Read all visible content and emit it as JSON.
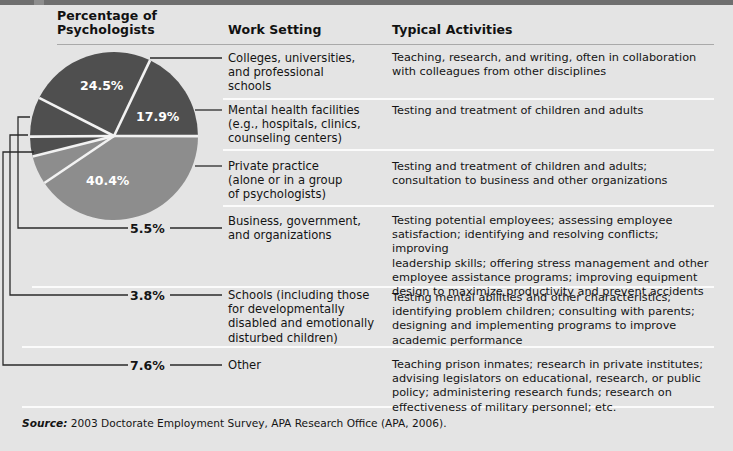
{
  "headers": {
    "percentage": "Percentage of\nPsychologists",
    "percentage_line1": "Percentage of",
    "percentage_line2": "Psychologists",
    "work_setting": "Work Setting",
    "typical_activities": "Typical Activities"
  },
  "source": {
    "label": "Source:",
    "text": "2003 Doctorate Employment Survey, APA Research Office (APA, 2006)."
  },
  "colors": {
    "background": "#e4e4e4",
    "slice_dark": "#4f4f4f",
    "slice_light": "#8d8d8d",
    "divider": "#fbfbfb",
    "header_rule": "#a9a9a9",
    "leader": "#2a2a2a",
    "slice_label": "#ffffff"
  },
  "rows": [
    {
      "percent": "24.5%",
      "setting_lines": [
        "Colleges, universities,",
        "and professional",
        "schools"
      ],
      "activity_lines": [
        "Teaching, research, and writing, often in collaboration",
        "with colleagues from other disciplines"
      ]
    },
    {
      "percent": "17.9%",
      "setting_lines": [
        "Mental health facilities",
        "(e.g., hospitals, clinics,",
        "counseling centers)"
      ],
      "activity_lines": [
        "Testing and treatment of children and adults"
      ]
    },
    {
      "percent": "40.4%",
      "setting_lines": [
        "Private practice",
        "(alone or in a group",
        "of psychologists)"
      ],
      "activity_lines": [
        "Testing and treatment of children and adults;",
        "consultation to business and other organizations"
      ]
    },
    {
      "percent": "5.5%",
      "setting_lines": [
        "Business, government,",
        "and organizations"
      ],
      "activity_lines": [
        "Testing potential employees; assessing employee",
        "satisfaction; identifying and resolving conflicts; improving",
        "leadership skills; offering stress management and other",
        "employee assistance programs; improving equipment",
        "design to maximize productivity and prevent accidents"
      ]
    },
    {
      "percent": "3.8%",
      "setting_lines": [
        "Schools (including those",
        "for developmentally",
        "disabled and emotionally",
        "disturbed children)"
      ],
      "activity_lines": [
        "Testing mental abilities and other characteristics;",
        "identifying problem children; consulting with parents;",
        "designing and implementing programs to improve",
        "academic performance"
      ]
    },
    {
      "percent": "7.6%",
      "setting_lines": [
        "Other"
      ],
      "activity_lines": [
        "Teaching prison inmates; research in private institutes;",
        "advising legislators on educational, research, or public",
        "policy; administering research funds; research on",
        "effectiveness of military personnel; etc."
      ]
    }
  ],
  "chart_data": {
    "type": "pie",
    "title": "Percentage of Psychologists",
    "categories": [
      "Colleges, universities, and professional schools",
      "Mental health facilities (e.g., hospitals, clinics, counseling centers)",
      "Private practice (alone or in a group of psychologists)",
      "Business, government, and organizations",
      "Schools (including those for developmentally disabled and emotionally disturbed children)",
      "Other"
    ],
    "labels": [
      "24.5%",
      "17.9%",
      "40.4%",
      "5.5%",
      "3.8%",
      "7.6%"
    ],
    "values": [
      24.5,
      17.9,
      40.4,
      5.5,
      3.8,
      7.6
    ],
    "units": "percent",
    "slice_colors": [
      "#4f4f4f",
      "#4f4f4f",
      "#8d8d8d",
      "#8d8d8d",
      "#4f4f4f",
      "#4f4f4f"
    ],
    "inside_labels": [
      "24.5%",
      "17.9%",
      "40.4%"
    ],
    "outside_labels": [
      "5.5%",
      "3.8%",
      "7.6%"
    ],
    "legend": "right",
    "grid": false,
    "xlabel": "",
    "ylabel": ""
  }
}
